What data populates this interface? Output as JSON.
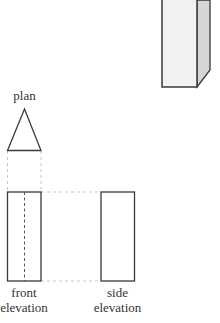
{
  "diagram": {
    "type": "orthographic-projection",
    "object": "rectangular prism with triangular plan",
    "labels": {
      "plan": "plan",
      "front_line1": "front",
      "front_line2": "elevation",
      "side_line1": "side",
      "side_line2": "elevation"
    },
    "colors": {
      "stroke": "#3a3a3a",
      "dashed": "#c8c8c8",
      "hidden_line": "#555555",
      "front_face": "#f1f1f1",
      "side_face": "#d6d6d6",
      "label": "#333333"
    }
  }
}
